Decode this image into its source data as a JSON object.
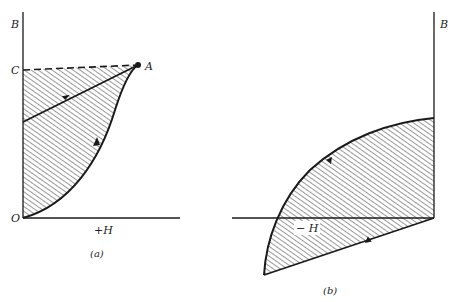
{
  "figure": {
    "panels": [
      {
        "id": "a",
        "caption": "(a)",
        "labels": {
          "y_axis": "B",
          "x_axis": "+H",
          "origin": "O",
          "point_c": "C",
          "point_a": "A"
        },
        "elements": [
          "dashed line C to A",
          "magnetization curve O to A",
          "return line to A with arrow",
          "hatched area"
        ]
      },
      {
        "id": "b",
        "caption": "(b)",
        "labels": {
          "y_axis": "B",
          "x_axis": "− H"
        },
        "elements": [
          "demagnetization curve",
          "recoil line",
          "hatched area"
        ]
      }
    ],
    "colors": {
      "ink": "#1a1a1a",
      "background": "#ffffff"
    }
  }
}
